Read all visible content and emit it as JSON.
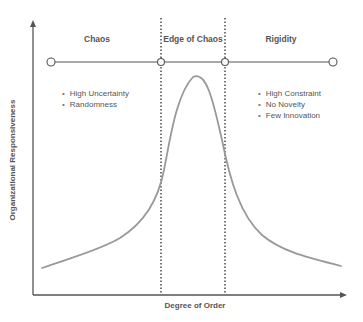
{
  "diagram": {
    "title": "Edge of Chaos",
    "x_axis_label": "Degree of Order",
    "y_axis_label": "Organizational Responsiveness",
    "regions": [
      {
        "name": "Chaos",
        "bullets": [
          "High Uncertainty",
          "Randomness"
        ]
      },
      {
        "name": "Edge of Chaos",
        "bullets": []
      },
      {
        "name": "Rigidity",
        "bullets": [
          "High Constraint",
          "No Novelty",
          "Few Innovation"
        ]
      }
    ],
    "colors": {
      "axis": "#555555",
      "curve": "#999999",
      "divider": "#555555",
      "text": "#555555"
    }
  }
}
